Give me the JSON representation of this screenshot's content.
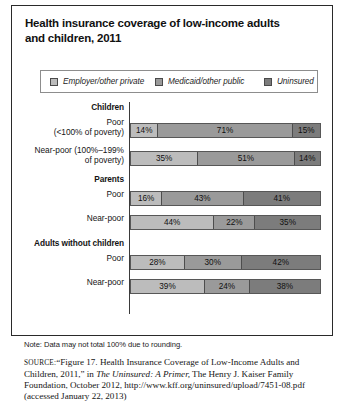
{
  "figure": {
    "title": "Health insurance coverage of low-income adults and children, 2011",
    "note": "Note: Data may not total 100% due to rounding.",
    "source": {
      "prefix": "SOURCE:",
      "text_1": "“Figure 17. Health Insurance Coverage of Low-Income Adults and Children, 2011,” in ",
      "italic_1": "The Uninsured: A Primer,",
      "text_2": " The Henry J. Kaiser Family Foundation, October 2012, http://www.kff.org/uninsured/upload/7451-08.pdf (accessed January 22, 2013)"
    }
  },
  "chart_data": {
    "type": "bar",
    "subtype": "stacked-horizontal-100",
    "title": "Health insurance coverage of low-income adults and children, 2011",
    "xlabel": "",
    "ylabel": "",
    "xlim": [
      0,
      100
    ],
    "grid": false,
    "legend_position": "top",
    "legend": [
      {
        "name": "Employer/other private",
        "color": "#bcbcbc"
      },
      {
        "name": "Medicaid/other public",
        "color": "#9a9a9a"
      },
      {
        "name": "Uninsured",
        "color": "#7c7c7c"
      }
    ],
    "series": [
      {
        "name": "Employer/other private",
        "values": [
          14,
          35,
          16,
          44,
          28,
          39
        ]
      },
      {
        "name": "Medicaid/other public",
        "values": [
          71,
          51,
          43,
          22,
          30,
          24
        ]
      },
      {
        "name": "Uninsured",
        "values": [
          15,
          14,
          41,
          35,
          42,
          38
        ]
      }
    ],
    "categories": [
      "Poor (<100% of poverty)",
      "Near-poor (100%–199% of poverty)",
      "Poor",
      "Near-poor",
      "Poor",
      "Near-poor"
    ],
    "groups": [
      "Children",
      "Parents",
      "Adults without children"
    ]
  },
  "rows": [
    {
      "kind": "group",
      "label": "Children",
      "label_2": ""
    },
    {
      "kind": "bar",
      "label": "Poor",
      "label_2": "(<100% of poverty)",
      "segments": [
        {
          "value": "14%",
          "pct": 14
        },
        {
          "value": "71%",
          "pct": 71
        },
        {
          "value": "15%",
          "pct": 15
        }
      ]
    },
    {
      "kind": "bar",
      "label": "Near-poor (100%–199%",
      "label_2": "of poverty)",
      "segments": [
        {
          "value": "35%",
          "pct": 35
        },
        {
          "value": "51%",
          "pct": 51
        },
        {
          "value": "14%",
          "pct": 14
        }
      ]
    },
    {
      "kind": "group",
      "label": "Parents",
      "label_2": ""
    },
    {
      "kind": "bar",
      "label": "Poor",
      "label_2": "",
      "segments": [
        {
          "value": "16%",
          "pct": 16
        },
        {
          "value": "43%",
          "pct": 43
        },
        {
          "value": "41%",
          "pct": 41
        }
      ]
    },
    {
      "kind": "bar",
      "label": "Near-poor",
      "label_2": "",
      "segments": [
        {
          "value": "44%",
          "pct": 44
        },
        {
          "value": "22%",
          "pct": 22
        },
        {
          "value": "35%",
          "pct": 35
        }
      ]
    },
    {
      "kind": "group",
      "label": "Adults without children",
      "label_2": ""
    },
    {
      "kind": "bar",
      "label": "Poor",
      "label_2": "",
      "segments": [
        {
          "value": "28%",
          "pct": 28
        },
        {
          "value": "30%",
          "pct": 30
        },
        {
          "value": "42%",
          "pct": 42
        }
      ]
    },
    {
      "kind": "bar",
      "label": "Near-poor",
      "label_2": "",
      "segments": [
        {
          "value": "39%",
          "pct": 39
        },
        {
          "value": "24%",
          "pct": 24
        },
        {
          "value": "38%",
          "pct": 38
        }
      ]
    }
  ]
}
